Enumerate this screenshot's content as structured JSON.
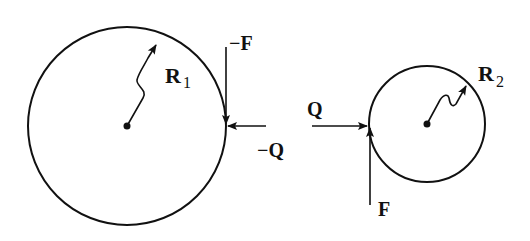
{
  "diagram": {
    "colors": {
      "stroke": "#111111",
      "background": "#ffffff"
    },
    "circles": [
      {
        "id": "body-1",
        "radius_label": "R",
        "radius_subscript": "1"
      },
      {
        "id": "body-2",
        "radius_label": "R",
        "radius_subscript": "2"
      }
    ],
    "forces": {
      "minus_f": {
        "label": "−F"
      },
      "minus_q": {
        "label": "−Q"
      },
      "q": {
        "label": "Q"
      },
      "f": {
        "label": "F"
      }
    }
  }
}
